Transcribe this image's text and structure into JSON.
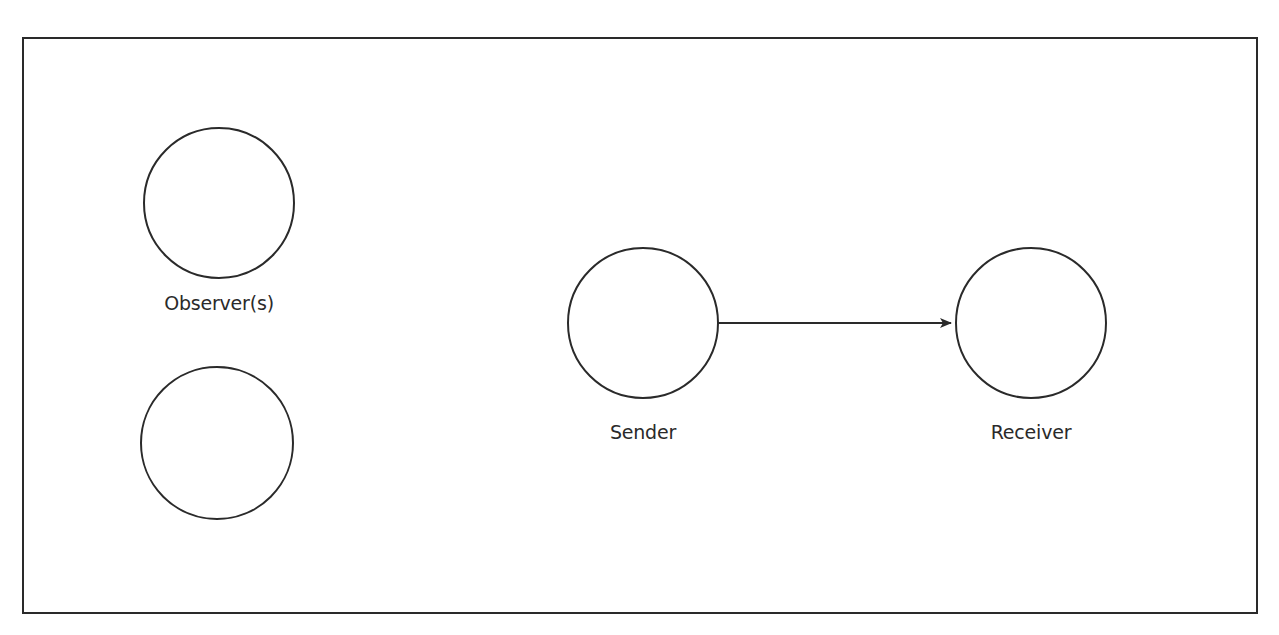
{
  "diagram": {
    "type": "communication-model",
    "frame": {
      "x": 23,
      "y": 38,
      "width": 1234,
      "height": 575,
      "stroke": "#2a2a2a"
    },
    "nodes": [
      {
        "id": "observer-1",
        "label": "Observer(s)",
        "cx": 219,
        "cy": 203,
        "r": 75
      },
      {
        "id": "observer-2",
        "label": "",
        "cx": 217,
        "cy": 443,
        "r": 75
      },
      {
        "id": "sender",
        "label": "Sender",
        "cx": 643,
        "cy": 323,
        "r": 75
      },
      {
        "id": "receiver",
        "label": "Receiver",
        "cx": 1031,
        "cy": 323,
        "r": 75
      }
    ],
    "edges": [
      {
        "from": "sender",
        "to": "receiver",
        "x1": 718,
        "y1": 323,
        "x2": 951,
        "y2": 323,
        "arrow": "end"
      }
    ],
    "labels": {
      "observer": "Observer(s)",
      "sender": "Sender",
      "receiver": "Receiver"
    },
    "stroke_color": "#2a2a2a",
    "background": "#ffffff"
  }
}
